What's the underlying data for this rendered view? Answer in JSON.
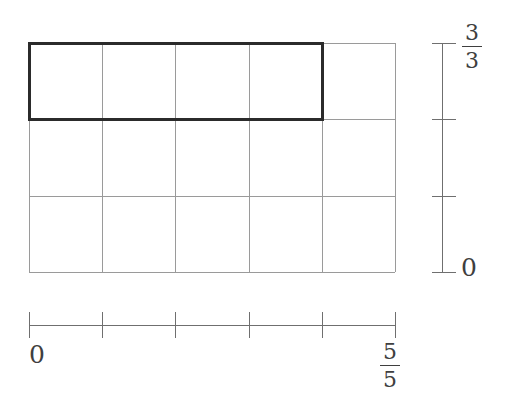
{
  "figure": {
    "kind": "fraction-area-grid",
    "background_color": "#ffffff",
    "grid": {
      "columns": 5,
      "rows": 3,
      "x": 29,
      "y": 43,
      "width": 366,
      "height": 229,
      "line_color": "#9a9a9a",
      "line_width": 1
    },
    "shaded_region": {
      "description": "bold outlined rectangle covering the top row, columns 1 through 4",
      "col_start": 0,
      "col_end": 4,
      "row_start": 0,
      "row_end": 1,
      "outline_color": "#2b2b2b",
      "outline_width": 2.4,
      "fill": "none"
    },
    "y_axis": {
      "x": 442,
      "y_top": 43,
      "y_bottom": 272,
      "tick_count": 4,
      "tick_length": 18,
      "line_color": "#6f6f6f",
      "top_label": {
        "numerator": "3",
        "denominator": "3"
      },
      "bottom_label": "0"
    },
    "x_axis": {
      "y": 325,
      "x_left": 29,
      "x_right": 395,
      "tick_count": 6,
      "tick_length": 18,
      "line_color": "#6f6f6f",
      "left_label": "0",
      "right_label": {
        "numerator": "5",
        "denominator": "5"
      }
    }
  },
  "chart_data": {
    "type": "area",
    "title": "",
    "xlabel": "",
    "ylabel": "",
    "grid": true,
    "legend": "none",
    "x_ticks": [
      "0",
      "1/5",
      "2/5",
      "3/5",
      "4/5",
      "5/5"
    ],
    "x_tick_labels_shown": [
      "0",
      "",
      "",
      "",
      "",
      "5/5"
    ],
    "y_ticks": [
      "0",
      "1/3",
      "2/3",
      "3/3"
    ],
    "y_tick_labels_shown": [
      "0",
      "",
      "",
      "3/3"
    ],
    "xlim": [
      0,
      1
    ],
    "ylim": [
      0,
      1
    ],
    "x_divisions": 5,
    "y_divisions": 3,
    "highlighted_cells": 4,
    "total_cells": 15,
    "highlight_rect": {
      "x0": "0",
      "x1": "4/5",
      "y0": "2/3",
      "y1": "3/3"
    },
    "fraction_represented": "4/5 x 1/3 = 4/15"
  }
}
